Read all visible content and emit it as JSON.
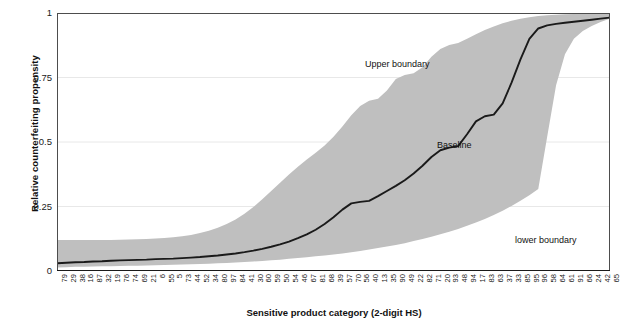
{
  "chart_data": {
    "type": "line",
    "title": "",
    "xlabel": "Sensitive product category (2-digit HS)",
    "ylabel": "Relative counterfeiting propensity",
    "ylim": [
      0,
      1
    ],
    "yticks": [
      0,
      0.25,
      0.5,
      0.75,
      1
    ],
    "ytick_labels": [
      "0",
      "0.25",
      "0.5",
      "0.75",
      "1"
    ],
    "grid": "horizontal",
    "legend": "none",
    "annotations": [
      {
        "name": "upper-boundary",
        "text": "Upper boundary",
        "x_index": 35,
        "y": 0.8
      },
      {
        "name": "baseline",
        "text": "Baseline",
        "x_index": 45,
        "y": 0.5
      },
      {
        "name": "lower-boundary",
        "text": "lower boundary",
        "x_index": 55,
        "y": 0.12
      }
    ],
    "categories": [
      "79",
      "29",
      "38",
      "16",
      "87",
      "32",
      "19",
      "76",
      "74",
      "69",
      "21",
      "6",
      "55",
      "5",
      "73",
      "44",
      "52",
      "34",
      "80",
      "97",
      "84",
      "41",
      "30",
      "60",
      "59",
      "50",
      "54",
      "46",
      "67",
      "81",
      "68",
      "39",
      "57",
      "70",
      "56",
      "40",
      "13",
      "35",
      "90",
      "49",
      "22",
      "82",
      "71",
      "20",
      "93",
      "48",
      "94",
      "17",
      "83",
      "63",
      "37",
      "33",
      "85",
      "95",
      "96",
      "58",
      "64",
      "61",
      "91",
      "66",
      "24",
      "42",
      "65"
    ],
    "series": [
      {
        "name": "Baseline",
        "color": "#1a1a1a",
        "values": [
          0.03,
          0.032,
          0.034,
          0.035,
          0.037,
          0.038,
          0.04,
          0.041,
          0.042,
          0.043,
          0.044,
          0.046,
          0.047,
          0.048,
          0.05,
          0.052,
          0.054,
          0.057,
          0.06,
          0.064,
          0.068,
          0.073,
          0.079,
          0.086,
          0.094,
          0.103,
          0.114,
          0.127,
          0.142,
          0.16,
          0.182,
          0.208,
          0.238,
          0.262,
          0.268,
          0.272,
          0.29,
          0.31,
          0.33,
          0.352,
          0.378,
          0.408,
          0.442,
          0.468,
          0.478,
          0.484,
          0.53,
          0.58,
          0.6,
          0.606,
          0.65,
          0.73,
          0.82,
          0.9,
          0.94,
          0.952,
          0.958,
          0.962,
          0.966,
          0.97,
          0.974,
          0.978,
          0.982
        ]
      },
      {
        "name": "Upper boundary",
        "color": "#b8b8b8",
        "values": [
          0.12,
          0.12,
          0.12,
          0.12,
          0.12,
          0.12,
          0.12,
          0.121,
          0.122,
          0.123,
          0.124,
          0.126,
          0.128,
          0.131,
          0.135,
          0.14,
          0.147,
          0.156,
          0.168,
          0.182,
          0.2,
          0.222,
          0.248,
          0.278,
          0.31,
          0.342,
          0.374,
          0.404,
          0.432,
          0.458,
          0.486,
          0.52,
          0.56,
          0.604,
          0.64,
          0.66,
          0.668,
          0.7,
          0.744,
          0.76,
          0.766,
          0.79,
          0.83,
          0.86,
          0.876,
          0.884,
          0.9,
          0.918,
          0.934,
          0.948,
          0.96,
          0.97,
          0.978,
          0.984,
          0.988,
          0.991,
          0.993,
          0.995,
          0.996,
          0.997,
          0.998,
          0.999,
          1.0
        ]
      },
      {
        "name": "lower boundary",
        "color": "#b8b8b8",
        "values": [
          0.014,
          0.015,
          0.016,
          0.016,
          0.017,
          0.018,
          0.018,
          0.019,
          0.02,
          0.02,
          0.021,
          0.022,
          0.023,
          0.024,
          0.025,
          0.026,
          0.027,
          0.028,
          0.03,
          0.031,
          0.033,
          0.035,
          0.037,
          0.039,
          0.042,
          0.044,
          0.047,
          0.05,
          0.053,
          0.057,
          0.06,
          0.064,
          0.068,
          0.073,
          0.078,
          0.083,
          0.089,
          0.095,
          0.101,
          0.108,
          0.116,
          0.124,
          0.133,
          0.142,
          0.152,
          0.163,
          0.175,
          0.188,
          0.202,
          0.217,
          0.234,
          0.252,
          0.272,
          0.294,
          0.318,
          0.52,
          0.72,
          0.84,
          0.9,
          0.93,
          0.95,
          0.965,
          0.978
        ]
      }
    ],
    "band_color": "#bfbfbf",
    "axis_color": "#4d4d4d",
    "grid_color": "#e8e8e8"
  }
}
